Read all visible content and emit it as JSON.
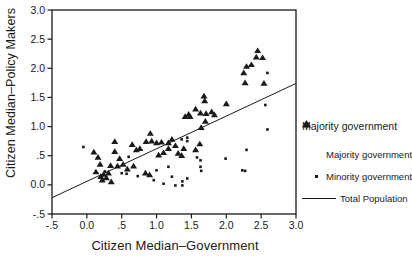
{
  "figure": {
    "bg": "#ffffff",
    "ink": "#1a1a1a"
  },
  "axes": {
    "y_title": "Citizen Median–Policy Makers",
    "x_title": "Citizen Median–Government"
  },
  "legend": {
    "title": "Majority government",
    "items": [
      {
        "marker": "triangle",
        "label": "Majority government"
      },
      {
        "marker": "dot",
        "label": "Minority government"
      },
      {
        "marker": "line",
        "label": "Total Population"
      }
    ]
  },
  "chart_data": {
    "type": "scatter",
    "title": "",
    "xlabel": "Citizen Median–Government",
    "ylabel": "Citizen Median–Policy Makers",
    "xlim": [
      -0.5,
      3.0
    ],
    "ylim": [
      -0.5,
      3.0
    ],
    "grid": false,
    "legend_position": "right",
    "x_ticks": [
      {
        "v": -0.5,
        "l": "-.5"
      },
      {
        "v": 0.0,
        "l": "0.0"
      },
      {
        "v": 0.5,
        "l": ".5"
      },
      {
        "v": 1.0,
        "l": "1.0"
      },
      {
        "v": 1.5,
        "l": "1.5"
      },
      {
        "v": 2.0,
        "l": "2.0"
      },
      {
        "v": 2.5,
        "l": "2.5"
      },
      {
        "v": 3.0,
        "l": "3.0"
      }
    ],
    "y_ticks": [
      {
        "v": 3.0,
        "l": "3.0"
      },
      {
        "v": 2.5,
        "l": "2.5"
      },
      {
        "v": 2.0,
        "l": "2.0"
      },
      {
        "v": 1.5,
        "l": "1.5"
      },
      {
        "v": 1.0,
        "l": "1.0"
      },
      {
        "v": 0.5,
        "l": ".5"
      },
      {
        "v": 0.0,
        "l": "0.0"
      },
      {
        "v": -0.5,
        "l": "-.5"
      }
    ],
    "series": [
      {
        "name": "Majority government",
        "marker": "triangle",
        "points": [
          [
            0.1,
            0.56
          ],
          [
            0.16,
            0.47
          ],
          [
            0.19,
            0.35
          ],
          [
            0.13,
            0.22
          ],
          [
            0.2,
            0.14
          ],
          [
            0.24,
            0.18
          ],
          [
            0.28,
            0.12
          ],
          [
            0.22,
            0.08
          ],
          [
            0.31,
            0.2
          ],
          [
            0.35,
            0.05
          ],
          [
            0.4,
            0.74
          ],
          [
            0.4,
            0.57
          ],
          [
            0.34,
            0.33
          ],
          [
            0.47,
            0.45
          ],
          [
            0.44,
            0.32
          ],
          [
            0.52,
            0.35
          ],
          [
            0.58,
            0.27
          ],
          [
            0.65,
            0.69
          ],
          [
            0.71,
            0.6
          ],
          [
            0.76,
            0.62
          ],
          [
            0.67,
            0.32
          ],
          [
            0.84,
            0.2
          ],
          [
            0.9,
            0.17
          ],
          [
            0.85,
            0.74
          ],
          [
            0.91,
            0.88
          ],
          [
            0.93,
            0.75
          ],
          [
            1.0,
            0.72
          ],
          [
            1.07,
            0.73
          ],
          [
            1.17,
            0.72
          ],
          [
            1.03,
            0.51
          ],
          [
            1.1,
            0.55
          ],
          [
            1.31,
            0.54
          ],
          [
            1.17,
            0.62
          ],
          [
            1.22,
            0.78
          ],
          [
            1.27,
            0.67
          ],
          [
            1.36,
            0.5
          ],
          [
            1.39,
            0.62
          ],
          [
            1.56,
            0.6
          ],
          [
            1.62,
            0.7
          ],
          [
            1.41,
            1.17
          ],
          [
            1.48,
            1.17
          ],
          [
            1.46,
            1.21
          ],
          [
            1.56,
            1.3
          ],
          [
            1.63,
            1.23
          ],
          [
            1.68,
            1.52
          ],
          [
            1.69,
            1.44
          ],
          [
            1.71,
            1.22
          ],
          [
            1.79,
            1.25
          ],
          [
            1.83,
            1.2
          ],
          [
            1.7,
            1.09
          ],
          [
            1.64,
            0.98
          ],
          [
            2.0,
            1.39
          ],
          [
            2.45,
            2.3
          ],
          [
            2.43,
            2.19
          ],
          [
            2.52,
            2.18
          ],
          [
            2.29,
            2.03
          ],
          [
            2.36,
            2.06
          ],
          [
            2.25,
            1.92
          ],
          [
            2.27,
            1.75
          ],
          [
            2.54,
            1.74
          ]
        ]
      },
      {
        "name": "Minority government",
        "marker": "dot",
        "points": [
          [
            -0.05,
            0.65
          ],
          [
            0.26,
            0.23
          ],
          [
            0.6,
            0.48
          ],
          [
            0.5,
            0.2
          ],
          [
            0.57,
            0.19
          ],
          [
            0.73,
            0.15
          ],
          [
            0.96,
            0.08
          ],
          [
            1.0,
            0.25
          ],
          [
            1.1,
            0.02
          ],
          [
            1.17,
            0.31
          ],
          [
            1.22,
            0.14
          ],
          [
            1.27,
            -0.01
          ],
          [
            1.36,
            0.78
          ],
          [
            1.44,
            0.81
          ],
          [
            1.44,
            0.75
          ],
          [
            1.58,
            0.47
          ],
          [
            1.63,
            0.42
          ],
          [
            1.63,
            0.31
          ],
          [
            1.64,
            0.24
          ],
          [
            1.44,
            0.11
          ],
          [
            1.37,
            0.06
          ],
          [
            1.37,
            -0.01
          ],
          [
            1.99,
            0.45
          ],
          [
            2.23,
            0.25
          ],
          [
            2.27,
            0.24
          ],
          [
            2.29,
            0.6
          ],
          [
            2.56,
            1.37
          ],
          [
            2.59,
            1.92
          ],
          [
            2.59,
            0.95
          ]
        ]
      },
      {
        "name": "Total Population",
        "type": "line",
        "points": [
          [
            -0.5,
            -0.22
          ],
          [
            3.0,
            1.74
          ]
        ]
      }
    ]
  }
}
